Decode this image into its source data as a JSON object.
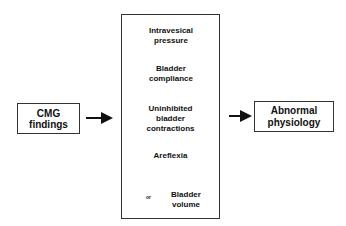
{
  "diagram": {
    "input_box": {
      "line1": "CMG",
      "line2": "findings"
    },
    "output_box": {
      "line1": "Abnormal",
      "line2": "physiology"
    },
    "findings": [
      {
        "line1": "Intravesical",
        "line2": "pressure",
        "arrow": "up"
      },
      {
        "line1": "Bladder",
        "line2": "compliance",
        "arrow": "down"
      },
      {
        "line1": "Uninhibited",
        "line2": "bladder",
        "line3": "contractions"
      },
      {
        "line1": "Areflexia"
      },
      {
        "line1": "Bladder",
        "line2": "volume",
        "arrow": "up-or-down",
        "or_label": "or"
      }
    ]
  }
}
